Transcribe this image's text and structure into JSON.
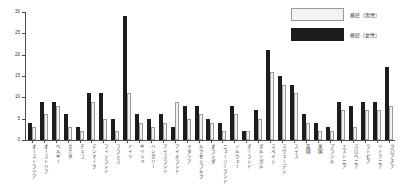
{
  "chart_data": {
    "type": "bar",
    "title": "",
    "xlabel": "",
    "ylabel": "",
    "ylim": [
      0,
      30
    ],
    "yticks": [
      0,
      5,
      10,
      15,
      20,
      25,
      30
    ],
    "grid": false,
    "legend_position": "top-right",
    "categories": [
      "オーストラリア",
      "オーストリア",
      "ベルギー",
      "カナダ",
      "チェコ",
      "デンマーク",
      "フィンランド",
      "フランス",
      "ドイツ",
      "ギリシャ",
      "ハンガリー",
      "アイスランド",
      "アイルランド",
      "イタリア",
      "ルクセンブルク",
      "オランダ",
      "ニュージーランド",
      "ノルウェー",
      "ポーランド",
      "ポルトガル",
      "スペイン",
      "スウェーデン",
      "スイス",
      "英国",
      "米国",
      "ブラジル",
      "エストニア",
      "スロベニア",
      "ラトビア",
      "リトアニア",
      "クロアチア"
    ],
    "series": [
      {
        "name": "移民（女性）",
        "color": "#1c1c1c",
        "values": [
          4,
          9,
          9,
          6,
          3,
          11,
          11,
          5,
          29,
          6,
          5,
          6,
          3,
          8,
          8,
          5,
          4,
          8,
          2,
          7,
          21,
          15,
          13,
          6,
          4,
          3,
          9,
          8,
          9,
          9,
          17
        ]
      },
      {
        "name": "移民（男性）",
        "color": "#f2f2f2",
        "values": [
          3,
          6,
          8,
          3,
          2,
          9,
          5,
          2,
          11,
          4,
          3,
          4,
          9,
          5,
          6,
          4,
          2,
          6,
          2,
          5,
          16,
          13,
          11,
          4,
          2,
          2,
          7,
          3,
          7,
          7,
          8
        ]
      }
    ]
  },
  "legend": {
    "entries": [
      {
        "label": "移民（男性）",
        "swatch": "light-swatch"
      },
      {
        "label": "移民（女性）",
        "swatch": "dark-swatch"
      }
    ]
  },
  "axis": {
    "y_tick_labels": [
      "0",
      "5",
      "10",
      "15",
      "20",
      "25",
      "30"
    ]
  }
}
